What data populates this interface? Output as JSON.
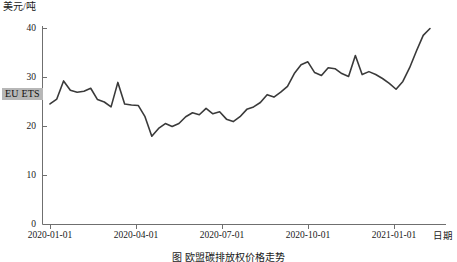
{
  "axes": {
    "y_title": "美元/吨",
    "x_title": "日期",
    "y_ticks": [
      "0",
      "10",
      "20",
      "30",
      "40"
    ],
    "x_ticks": [
      "2020-01-01",
      "2020-04-01",
      "2020-07-01",
      "2020-10-01",
      "2021-01-01"
    ]
  },
  "series_label": "EU ETS",
  "caption": "图 欧盟碳排放权价格走势",
  "colors": {
    "line": "#3a3a3a",
    "axis": "#6f6f6f",
    "text": "#1a1a1a",
    "label_highlight": "#b7b7b7"
  },
  "chart_data": {
    "type": "line",
    "title": "",
    "xlabel": "日期",
    "ylabel": "美元/吨",
    "ylim": [
      0,
      40
    ],
    "yticks": [
      0,
      10,
      20,
      30,
      40
    ],
    "xlim": [
      "2020-01-01",
      "2021-02-01"
    ],
    "xticks": [
      "2020-01-01",
      "2020-04-01",
      "2020-07-01",
      "2020-10-01",
      "2021-01-01"
    ],
    "grid": false,
    "legend": "none",
    "series": [
      {
        "name": "EU ETS",
        "color": "#3a3a3a",
        "x": [
          "2020-01-02",
          "2020-01-09",
          "2020-01-16",
          "2020-01-23",
          "2020-01-30",
          "2020-02-06",
          "2020-02-13",
          "2020-02-20",
          "2020-02-27",
          "2020-03-05",
          "2020-03-12",
          "2020-03-19",
          "2020-03-26",
          "2020-04-02",
          "2020-04-09",
          "2020-04-16",
          "2020-04-23",
          "2020-04-30",
          "2020-05-07",
          "2020-05-14",
          "2020-05-21",
          "2020-05-28",
          "2020-06-04",
          "2020-06-11",
          "2020-06-18",
          "2020-06-25",
          "2020-07-02",
          "2020-07-09",
          "2020-07-16",
          "2020-07-23",
          "2020-07-30",
          "2020-08-06",
          "2020-08-13",
          "2020-08-20",
          "2020-08-27",
          "2020-09-03",
          "2020-09-10",
          "2020-09-17",
          "2020-09-24",
          "2020-10-01",
          "2020-10-08",
          "2020-10-15",
          "2020-10-22",
          "2020-10-29",
          "2020-11-05",
          "2020-11-12",
          "2020-11-19",
          "2020-11-26",
          "2020-12-03",
          "2020-12-10",
          "2020-12-17",
          "2020-12-24",
          "2020-12-31",
          "2021-01-07",
          "2021-01-14",
          "2021-01-21",
          "2021-01-28"
        ],
        "values": [
          24.6,
          25.6,
          29.3,
          27.4,
          27.0,
          27.2,
          27.8,
          25.5,
          25.0,
          24.0,
          29.0,
          24.6,
          24.4,
          24.3,
          22.0,
          18.0,
          19.6,
          20.6,
          20.0,
          20.6,
          22.0,
          22.8,
          22.4,
          23.7,
          22.6,
          23.0,
          21.5,
          21.0,
          22.0,
          23.5,
          24.0,
          24.9,
          26.5,
          26.0,
          27.0,
          28.2,
          30.8,
          32.6,
          33.2,
          31.0,
          30.4,
          32.0,
          31.8,
          30.8,
          30.2,
          34.5,
          30.6,
          31.2,
          30.6,
          29.8,
          28.8,
          27.6,
          29.2,
          32.0,
          35.4,
          38.6,
          40.0
        ]
      }
    ],
    "annotations": [
      {
        "text": "EU ETS",
        "x": "2020-01-01",
        "y": 29,
        "style": "highlight-box"
      }
    ]
  }
}
